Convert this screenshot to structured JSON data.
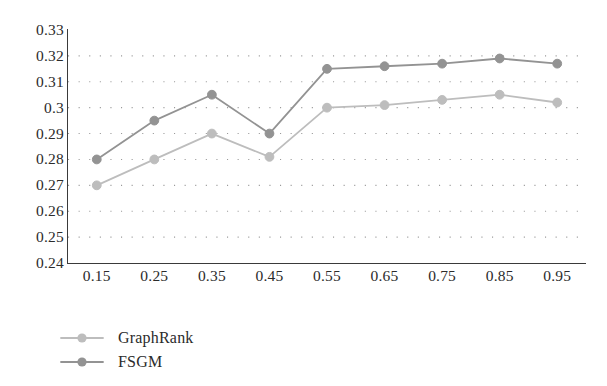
{
  "chart_data": {
    "type": "line",
    "title": "",
    "xlabel": "",
    "ylabel": "",
    "x": [
      0.15,
      0.25,
      0.35,
      0.45,
      0.55,
      0.65,
      0.75,
      0.85,
      0.95
    ],
    "x_tick_labels": [
      "0.15",
      "0.25",
      "0.35",
      "0.45",
      "0.55",
      "0.65",
      "0.75",
      "0.85",
      "0.95"
    ],
    "y_tick_labels": [
      "0.33",
      "0.32",
      "0.31",
      "0.3",
      "0.29",
      "0.28",
      "0.27",
      "0.26",
      "0.25",
      "0.24"
    ],
    "y_ticks": [
      0.33,
      0.32,
      0.31,
      0.3,
      0.29,
      0.28,
      0.27,
      0.26,
      0.25,
      0.24
    ],
    "xlim": [
      0.1,
      1.0
    ],
    "ylim": [
      0.24,
      0.33
    ],
    "grid": "dotted-horizontal",
    "legend_position": "below-left",
    "series": [
      {
        "name": "GraphRank",
        "color": "#bdbdbd",
        "marker": "circle",
        "values": [
          0.27,
          0.28,
          0.29,
          0.281,
          0.3,
          0.301,
          0.303,
          0.305,
          0.302
        ]
      },
      {
        "name": "FSGM",
        "color": "#939393",
        "marker": "circle",
        "values": [
          0.28,
          0.295,
          0.305,
          0.29,
          0.315,
          0.316,
          0.317,
          0.319,
          0.317
        ]
      }
    ]
  },
  "legend": {
    "items": [
      {
        "label": "GraphRank"
      },
      {
        "label": "FSGM"
      }
    ]
  },
  "axis_colors": {
    "spine": "#3a3a3a",
    "grid_dot": "#9a9a9a",
    "text": "#2b2b2b"
  }
}
